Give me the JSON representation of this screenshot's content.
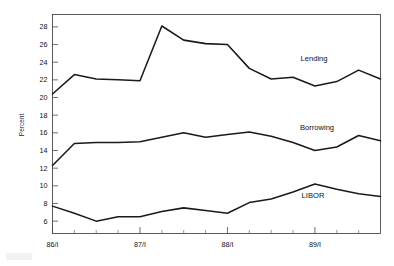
{
  "figure": {
    "title": "",
    "background_color": "#ffffff",
    "line_color": "#1a1a1a",
    "axis_color": "#4a4a4a"
  },
  "axes": {
    "ylabel": "Percent",
    "ytick_labels": [
      "6",
      "8",
      "10",
      "12",
      "14",
      "16",
      "18",
      "20",
      "22",
      "24",
      "26",
      "28"
    ],
    "xtick_labels": [
      "86/I",
      "87/I",
      "88/I",
      "89/I"
    ],
    "ylim": [
      4.6,
      29.4
    ],
    "xlim": [
      0,
      15
    ],
    "grid": false
  },
  "series_labels": {
    "lending": "Lending",
    "borrowing": "Borrowing",
    "libor": "LIBOR"
  },
  "chart_data": {
    "type": "line",
    "title": "",
    "xlabel": "",
    "ylabel": "Percent",
    "ylim": [
      4.6,
      29.4
    ],
    "grid": false,
    "legend_position": "inline-annotation",
    "categories": [
      "86/I",
      "86/II",
      "86/III",
      "86/IV",
      "87/I",
      "87/II",
      "87/III",
      "87/IV",
      "88/I",
      "88/II",
      "88/III",
      "88/IV",
      "89/I",
      "89/II",
      "89/III",
      "89/IV"
    ],
    "xtick_major": [
      "86/I",
      "87/I",
      "88/I",
      "89/I"
    ],
    "series": [
      {
        "name": "Lending",
        "values": [
          20.4,
          22.6,
          22.1,
          22.0,
          21.9,
          28.1,
          26.5,
          26.1,
          26.0,
          23.3,
          22.1,
          22.3,
          21.3,
          21.8,
          23.1,
          22.1
        ]
      },
      {
        "name": "Borrowing",
        "values": [
          12.3,
          14.8,
          14.9,
          14.9,
          15.0,
          15.5,
          16.0,
          15.5,
          15.8,
          16.1,
          15.6,
          14.9,
          14.0,
          14.4,
          15.7,
          15.1
        ]
      },
      {
        "name": "LIBOR",
        "values": [
          7.7,
          6.9,
          6.0,
          6.5,
          6.5,
          7.1,
          7.5,
          7.2,
          6.9,
          8.1,
          8.5,
          9.3,
          10.2,
          9.6,
          9.1,
          8.8
        ]
      }
    ]
  }
}
